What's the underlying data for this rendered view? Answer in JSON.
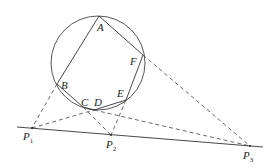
{
  "diagram": {
    "type": "geometry",
    "circle": {
      "cx": 98,
      "cy": 63,
      "r": 47
    },
    "points": {
      "A": [
        99,
        16
      ],
      "B": [
        57,
        84
      ],
      "C": [
        83,
        107
      ],
      "D": [
        94,
        110
      ],
      "E": [
        126,
        100
      ],
      "F": [
        143,
        55
      ],
      "P1": [
        32,
        128
      ],
      "P2": [
        111,
        135
      ],
      "P3": [
        250,
        146
      ]
    },
    "labels": [
      {
        "id": "A",
        "text": "A",
        "x": 97,
        "y": 22
      },
      {
        "id": "B",
        "text": "B",
        "x": 61,
        "y": 80
      },
      {
        "id": "C",
        "text": "C",
        "x": 81,
        "y": 97
      },
      {
        "id": "D",
        "text": "D",
        "x": 94,
        "y": 97
      },
      {
        "id": "E",
        "text": "E",
        "x": 117,
        "y": 88
      },
      {
        "id": "F",
        "text": "F",
        "x": 130,
        "y": 56
      },
      {
        "id": "P1",
        "text": "P",
        "sub": "1",
        "x": 23,
        "y": 131
      },
      {
        "id": "P2",
        "text": "P",
        "sub": "2",
        "x": 106,
        "y": 139
      },
      {
        "id": "P3",
        "text": "P",
        "sub": "3",
        "x": 243,
        "y": 150
      }
    ]
  }
}
